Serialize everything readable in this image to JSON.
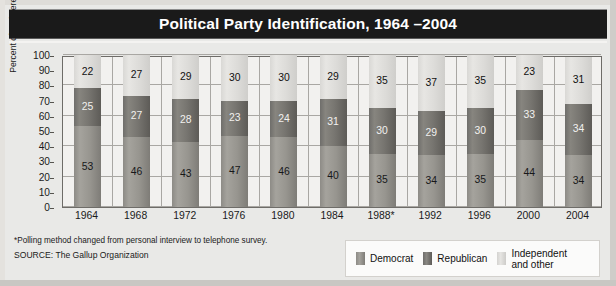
{
  "title": "Political Party Identification, 1964 –2004",
  "footnote": "*Polling method changed from personal interview to telephone survey.",
  "source": "SOURCE: The Gallup Organization",
  "colors": {
    "title_bar": "#1a1a1a",
    "democrat": "#97958f",
    "republican": "#777570",
    "independent": "#dcdbd8",
    "plot_background": "#f2f1ef",
    "page_background": "#e9e9e7"
  },
  "legend": {
    "items": [
      {
        "label": "Democrat",
        "swatch": "democrat"
      },
      {
        "label": "Republican",
        "swatch": "republican"
      },
      {
        "label": "Independent\nand other",
        "swatch": "independent"
      }
    ]
  },
  "chart_data": {
    "type": "bar",
    "stacked": true,
    "title": "Political Party Identification, 1964 –2004",
    "xlabel": "",
    "ylabel": "Percent of registered voters",
    "ylim": [
      0,
      100
    ],
    "ytick_step": 10,
    "ytick_labels": [
      "100",
      "90",
      "80",
      "70",
      "60",
      "50",
      "40",
      "30",
      "20",
      "10",
      "0"
    ],
    "gridline_values": [
      0,
      20,
      40,
      60,
      80,
      100
    ],
    "grid": true,
    "legend_position": "bottom-right",
    "categories": [
      "1964",
      "1968",
      "1972",
      "1976",
      "1980",
      "1984",
      "1988*",
      "1992",
      "1996",
      "2000",
      "2004"
    ],
    "series": [
      {
        "name": "Democrat",
        "values": [
          53,
          46,
          43,
          47,
          46,
          40,
          35,
          34,
          35,
          44,
          34
        ]
      },
      {
        "name": "Republican",
        "values": [
          25,
          27,
          28,
          23,
          24,
          31,
          30,
          29,
          30,
          33,
          34
        ]
      },
      {
        "name": "Independent and other",
        "values": [
          22,
          27,
          29,
          30,
          30,
          29,
          35,
          37,
          35,
          23,
          31
        ]
      }
    ]
  }
}
